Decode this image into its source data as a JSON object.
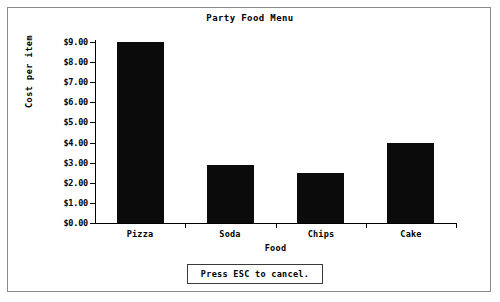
{
  "window": {
    "frame_color": "#8a8a8a",
    "background": "#ffffff"
  },
  "status_bar": {
    "message": "Press ESC to cancel."
  },
  "chart_data": {
    "type": "bar",
    "title": "Party Food Menu",
    "xlabel": "Food",
    "ylabel": "Cost per item",
    "categories": [
      "Pizza",
      "Soda",
      "Chips",
      "Cake"
    ],
    "values": [
      9.0,
      2.9,
      2.5,
      4.0
    ],
    "ylim": [
      0,
      9
    ],
    "ytick_values": [
      0,
      1,
      2,
      3,
      4,
      5,
      6,
      7,
      8,
      9
    ],
    "ytick_labels": [
      "$0.00",
      "$1.00",
      "$2.00",
      "$3.00",
      "$4.00",
      "$5.00",
      "$6.00",
      "$7.00",
      "$8.00",
      "$9.00"
    ],
    "grid": false,
    "legend": false,
    "bar_color": "#0b0b0b",
    "axis_color": "#000000"
  }
}
